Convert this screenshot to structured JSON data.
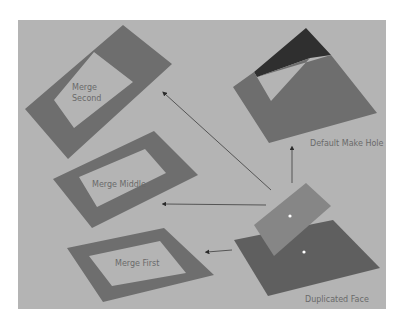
{
  "labels": {
    "merge_second_1": "Merge",
    "merge_second_2": "Second",
    "merge_middle": "Merge Middle",
    "merge_first": "Merge First",
    "default_make_hole": "Default Make Hole",
    "duplicated_face": "Duplicated Face"
  },
  "colors": {
    "background": "#b4b4b4",
    "face_dark": "#6e6e6e",
    "face_darker": "#5f5f5f",
    "face_lifted": "#868686",
    "face_black": "#2f2f2f",
    "arrow": "#3c3c3c"
  }
}
